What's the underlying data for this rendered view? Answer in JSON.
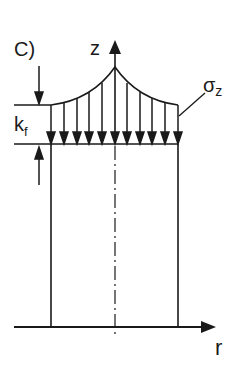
{
  "diagram": {
    "panel_label": "C)",
    "axis_vertical_label": "z",
    "axis_horizontal_label": "r",
    "stress_label_main": "σ",
    "stress_label_sub": "z",
    "layer_label_main": "k",
    "layer_label_sub": "f",
    "colors": {
      "stroke": "#1a1a1a",
      "background": "#ffffff"
    },
    "stress_arrow_count": 11
  }
}
